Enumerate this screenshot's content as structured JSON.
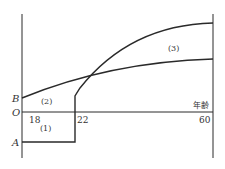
{
  "diagram": {
    "axis_labels": {
      "origin": "O",
      "point_b": "B",
      "point_a": "A",
      "x_axis": "年齢"
    },
    "ticks": [
      "18",
      "22",
      "60"
    ],
    "regions": [
      "(1)",
      "(2)",
      "(3)"
    ],
    "colors": {
      "line": "#2a2a2a",
      "text": "#333333",
      "background": "#ffffff"
    }
  }
}
